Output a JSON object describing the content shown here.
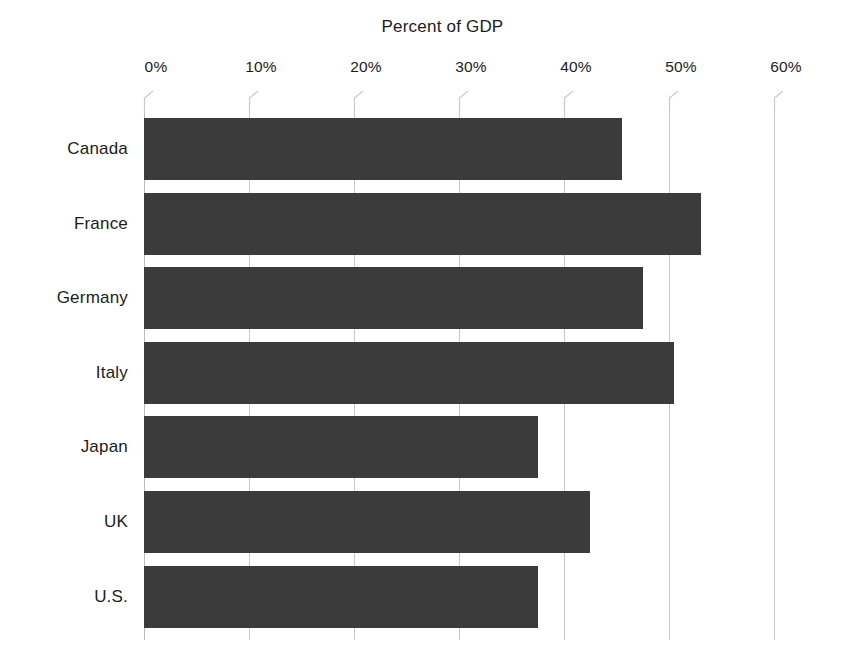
{
  "chart_data": {
    "type": "bar",
    "orientation": "horizontal",
    "title": "Percent of GDP",
    "xlabel": "",
    "ylabel": "",
    "categories": [
      "Canada",
      "France",
      "Germany",
      "Italy",
      "Japan",
      "UK",
      "U.S."
    ],
    "values": [
      45.5,
      53.0,
      47.5,
      50.5,
      37.5,
      42.5,
      37.5
    ],
    "xlim": [
      0,
      60
    ],
    "xticks": [
      0,
      10,
      20,
      30,
      40,
      50,
      60
    ],
    "xtick_labels": [
      "0%",
      "10%",
      "20%",
      "30%",
      "40%",
      "50%",
      "60%"
    ],
    "grid": true,
    "legend": false,
    "series": [
      {
        "name": "Percent of GDP",
        "values": [
          45.5,
          53.0,
          47.5,
          50.5,
          37.5,
          42.5,
          37.5
        ]
      }
    ],
    "colors": {
      "bar": "#3b3b3b",
      "gridline": "#c9c9c9",
      "text": "#1c1c1c",
      "background": "#ffffff"
    }
  }
}
